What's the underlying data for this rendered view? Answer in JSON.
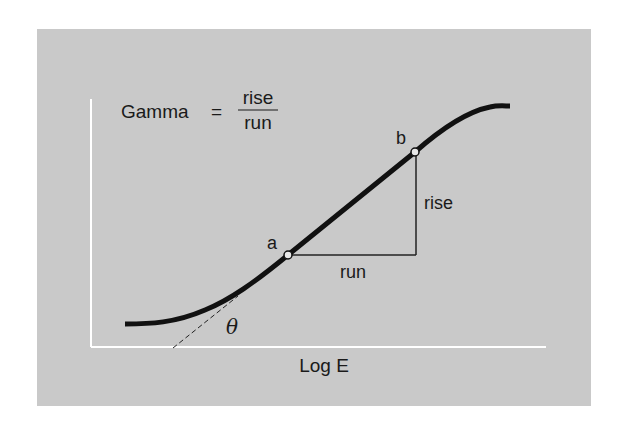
{
  "formula": {
    "lhs": "Gamma",
    "equals": "=",
    "numerator": "rise",
    "denominator": "run"
  },
  "points": {
    "a": {
      "label": "a"
    },
    "b": {
      "label": "b"
    }
  },
  "triangle": {
    "rise_label": "rise",
    "run_label": "run"
  },
  "angle": {
    "label": "θ"
  },
  "axes": {
    "xlabel": "Log E",
    "ylabel": ""
  },
  "colors": {
    "panel_bg": "#c9c9c9",
    "axis": "#ffffff",
    "curve": "#111111",
    "text": "#1a1a1a"
  }
}
